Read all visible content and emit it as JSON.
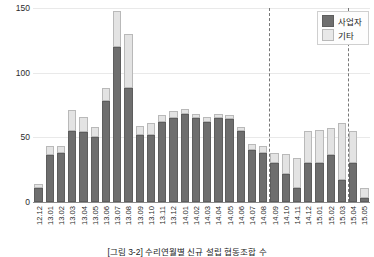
{
  "chart_data": {
    "type": "bar",
    "stacked": true,
    "title": "",
    "xlabel": "",
    "ylabel": "수리연월별 설립 협동조합 수",
    "ylim": [
      0,
      150
    ],
    "yticks": [
      0,
      50,
      100,
      150
    ],
    "grid": true,
    "legend_position": "top-right",
    "categories": [
      "12.12",
      "13.01",
      "13.02",
      "13.03",
      "13.04",
      "13.05",
      "13.06",
      "13.07",
      "13.08",
      "13.09",
      "13.10",
      "13.11",
      "13.12",
      "14.01",
      "14.02",
      "14.03",
      "14.04",
      "14.05",
      "14.06",
      "14.07",
      "14.08",
      "14.09",
      "14.10",
      "14.11",
      "14.12",
      "15.01",
      "15.02",
      "15.03",
      "15.04",
      "15.05"
    ],
    "series": [
      {
        "name": "사업자",
        "color": "#6e6e6e",
        "values": [
          11,
          36,
          38,
          55,
          54,
          50,
          78,
          120,
          88,
          52,
          52,
          62,
          65,
          68,
          65,
          62,
          65,
          64,
          55,
          40,
          38,
          30,
          22,
          11,
          30,
          30,
          36,
          17,
          30,
          3
        ]
      },
      {
        "name": "기타",
        "color": "#e3e3e3",
        "values": [
          3,
          7,
          5,
          16,
          12,
          8,
          10,
          28,
          42,
          7,
          9,
          5,
          5,
          4,
          3,
          4,
          3,
          3,
          3,
          5,
          5,
          8,
          15,
          23,
          25,
          26,
          21,
          44,
          25,
          8
        ]
      }
    ],
    "reference_lines": [
      {
        "after_category": "14.08",
        "style": "dashed"
      },
      {
        "after_category": "15.03",
        "style": "dashed"
      }
    ]
  },
  "caption": {
    "text": "[그림 3-2] 수리연월별 신규 설립 협동조합 수"
  }
}
